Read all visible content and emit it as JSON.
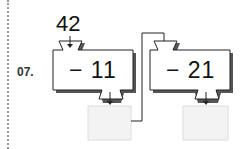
{
  "problem": {
    "number": "07.",
    "start_value": "42",
    "steps": [
      {
        "operation": "− 11",
        "answer": ""
      },
      {
        "operation": "− 21",
        "answer": ""
      }
    ]
  },
  "colors": {
    "line": "#222222",
    "shadow": "#555555",
    "answer_fill": "#f3f3f3",
    "answer_border": "#dddddd"
  }
}
